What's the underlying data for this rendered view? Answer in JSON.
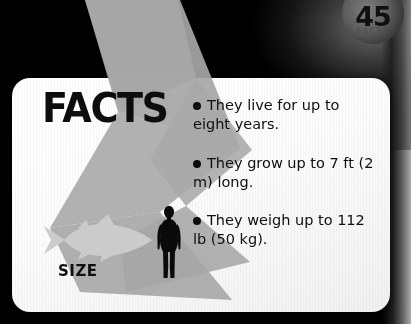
{
  "page": {
    "number": "45",
    "badge_word": "FACTS"
  },
  "card": {
    "heading": "FACTS",
    "bullets": [
      "They live for up to eight years.",
      "They grow up to 7 ft (2 m) long.",
      "They weigh up to 112 lb (50 kg)."
    ],
    "size_label": "SIZE"
  },
  "colors": {
    "background": "#000000",
    "card": "#fbfbfb",
    "zigzag": "#a8a8a8",
    "fish": "#cfcfcf",
    "human": "#0a0a0a",
    "text": "#0f0f0f"
  },
  "icons": {
    "fish": "fish-silhouette-icon",
    "human": "human-silhouette-icon",
    "bullet": "bullet-dot-icon"
  }
}
